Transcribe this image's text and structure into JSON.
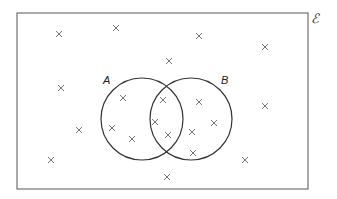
{
  "diagram": {
    "type": "venn",
    "universal_set_label": "ℰ",
    "sets": [
      {
        "name": "A",
        "label": "A",
        "cx": 142,
        "cy": 119,
        "r": 41
      },
      {
        "name": "B",
        "label": "B",
        "cx": 191,
        "cy": 119,
        "r": 41
      }
    ],
    "rectangle": {
      "x": 17,
      "y": 13,
      "width": 291,
      "height": 176
    },
    "colors": {
      "outline": "#555555",
      "circle": "#333333",
      "cross": "#666666"
    },
    "regions": {
      "outside": 10,
      "A_only": 3,
      "A_and_B": 3,
      "B_only": 4
    },
    "elements": [
      {
        "region": "outside",
        "x": 59,
        "y": 34
      },
      {
        "region": "outside",
        "x": 116,
        "y": 28
      },
      {
        "region": "outside",
        "x": 199,
        "y": 36
      },
      {
        "region": "outside",
        "x": 265,
        "y": 47
      },
      {
        "region": "outside",
        "x": 169,
        "y": 61
      },
      {
        "region": "outside",
        "x": 61,
        "y": 88
      },
      {
        "region": "outside",
        "x": 79,
        "y": 130
      },
      {
        "region": "outside",
        "x": 51,
        "y": 160
      },
      {
        "region": "outside",
        "x": 265,
        "y": 106
      },
      {
        "region": "outside",
        "x": 245,
        "y": 160
      },
      {
        "region": "outside",
        "x": 167,
        "y": 177
      },
      {
        "region": "A_only",
        "x": 123,
        "y": 98
      },
      {
        "region": "A_only",
        "x": 112,
        "y": 128
      },
      {
        "region": "A_only",
        "x": 132,
        "y": 139
      },
      {
        "region": "A_and_B",
        "x": 163,
        "y": 100
      },
      {
        "region": "A_and_B",
        "x": 155,
        "y": 122
      },
      {
        "region": "A_and_B",
        "x": 168,
        "y": 135
      },
      {
        "region": "B_only",
        "x": 199,
        "y": 102
      },
      {
        "region": "B_only",
        "x": 214,
        "y": 123
      },
      {
        "region": "B_only",
        "x": 192,
        "y": 132
      },
      {
        "region": "B_only",
        "x": 193,
        "y": 153
      }
    ]
  }
}
